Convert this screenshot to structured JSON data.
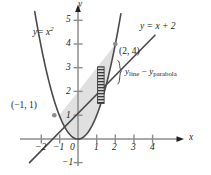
{
  "figure": {
    "background_color": "#ffffff",
    "ink_color": "#231f20",
    "shade_fill": "#e0e0e0",
    "hatch_fill": "#b5b5b5"
  },
  "axes": {
    "x_axis_name": "x",
    "y_axis_name": "y",
    "x_ticks": [
      {
        "value": -2,
        "label": "−2"
      },
      {
        "value": -1,
        "label": "−1"
      },
      {
        "value": 0,
        "label": "0"
      },
      {
        "value": 1,
        "label": "1"
      },
      {
        "value": 2,
        "label": "2"
      },
      {
        "value": 3,
        "label": "3"
      },
      {
        "value": 4,
        "label": "4"
      }
    ],
    "y_ticks": [
      {
        "value": -1,
        "label": "−1"
      },
      {
        "value": 1,
        "label": "1"
      },
      {
        "value": 2,
        "label": "2"
      },
      {
        "value": 3,
        "label": "3"
      },
      {
        "value": 4,
        "label": "4"
      },
      {
        "value": 5,
        "label": "5"
      }
    ]
  },
  "curves": {
    "parabola_label_lhs": "y",
    "parabola_label_eq": "= x",
    "parabola_label_exp": "2",
    "line_label": "y = x + 2"
  },
  "points": [
    {
      "name": "lower-intersection",
      "label": "(−1, 1)",
      "x": -1,
      "y": 1
    },
    {
      "name": "upper-intersection",
      "label": "(2, 4)",
      "x": 2,
      "y": 4
    }
  ],
  "annotation": {
    "diff_y1": "y",
    "diff_sub1": "line",
    "diff_minus": "−",
    "diff_y2": "y",
    "diff_sub2": "parabola"
  },
  "chart_data": {
    "type": "line",
    "xlabel": "x",
    "ylabel": "y",
    "xlim": [
      -2.6,
      4.9
    ],
    "ylim": [
      -1.4,
      5.6
    ],
    "grid": false,
    "legend": "none",
    "xticks": [
      -2,
      -1,
      0,
      1,
      2,
      3,
      4
    ],
    "yticks": [
      -1,
      1,
      2,
      3,
      4,
      5
    ],
    "series": [
      {
        "name": "y = x^2",
        "equation": "y = x^2",
        "label_text": "y = x²",
        "x": [
          -2.3,
          -2.0,
          -1.5,
          -1.0,
          -0.5,
          0.0,
          0.5,
          1.0,
          1.5,
          2.0,
          2.4
        ],
        "y": [
          5.29,
          4.0,
          2.25,
          1.0,
          0.25,
          0.0,
          0.25,
          1.0,
          2.25,
          4.0,
          5.76
        ]
      },
      {
        "name": "y = x + 2",
        "equation": "y = x + 2",
        "label_text": "y = x + 2",
        "x": [
          -2.6,
          -1.0,
          0.0,
          2.0,
          3.0
        ],
        "y": [
          -0.6,
          1.0,
          2.0,
          4.0,
          5.0
        ]
      }
    ],
    "shaded_region": {
      "description": "Area between line and parabola from x = -1 to x = 2",
      "x_from": -1,
      "x_to": 2,
      "upper": "y = x + 2",
      "lower": "y = x^2",
      "fill": "#e0e0e0"
    },
    "representative_rectangle": {
      "description": "Hatched vertical strip showing y_line - y_parabola",
      "x_left": 1.05,
      "x_right": 1.4,
      "y_bottom": 1.5,
      "y_top": 3.05
    },
    "annotations": [
      {
        "text": "(−1, 1)",
        "x": -1,
        "y": 1
      },
      {
        "text": "(2, 4)",
        "x": 2,
        "y": 4
      },
      {
        "text": "y_line − y_parabola",
        "x": 2.0,
        "y": 2.3
      }
    ]
  }
}
